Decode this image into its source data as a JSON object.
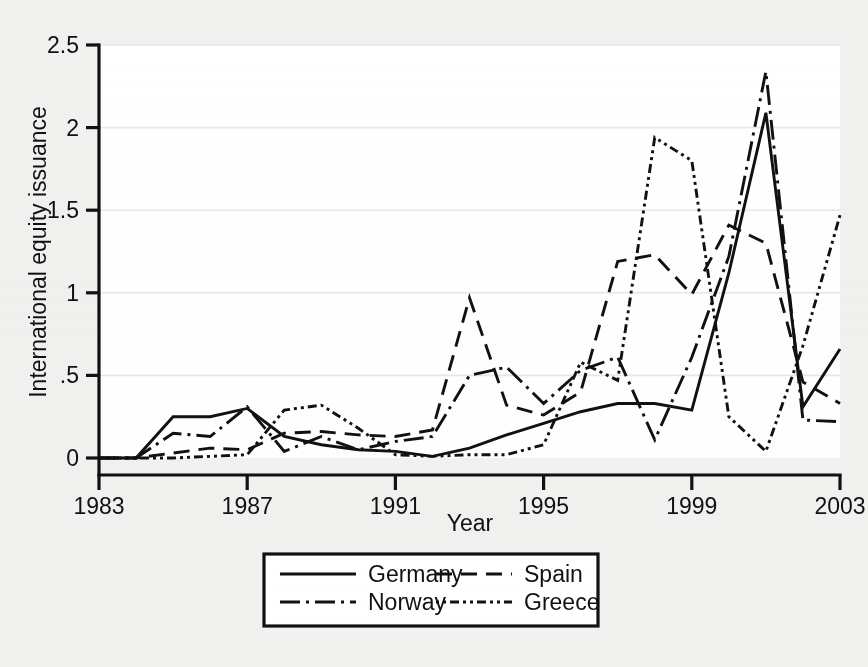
{
  "chart_data": {
    "type": "line",
    "title": "",
    "xlabel": "Year",
    "ylabel": "International equity issuance",
    "xlim": [
      1983,
      2003
    ],
    "ylim": [
      0,
      2.5
    ],
    "x_ticks": [
      1983,
      1987,
      1991,
      1995,
      1999,
      2003
    ],
    "x_tick_labels": [
      "1983",
      "1987",
      "1991",
      "1995",
      "1999",
      "2003"
    ],
    "y_ticks": [
      0,
      0.5,
      1,
      1.5,
      2,
      2.5
    ],
    "y_tick_labels": [
      "0",
      ".5",
      "1",
      "1.5",
      "2",
      "2.5"
    ],
    "grid": "horizontal",
    "legend_position": "bottom-center",
    "x": [
      1983,
      1984,
      1985,
      1986,
      1987,
      1988,
      1989,
      1990,
      1991,
      1992,
      1993,
      1994,
      1995,
      1996,
      1997,
      1998,
      1999,
      2000,
      2001,
      2002,
      2003
    ],
    "series": [
      {
        "name": "Germany",
        "style": "solid",
        "values": [
          0,
          0,
          0.25,
          0.25,
          0.3,
          0.13,
          0.08,
          0.05,
          0.04,
          0.01,
          0.06,
          0.14,
          0.21,
          0.28,
          0.33,
          0.33,
          0.29,
          1.12,
          2.09,
          0.31,
          0.66
        ]
      },
      {
        "name": "Spain",
        "style": "dashed",
        "values": [
          0,
          0,
          0.03,
          0.06,
          0.05,
          0.15,
          0.16,
          0.14,
          0.13,
          0.17,
          0.97,
          0.32,
          0.26,
          0.4,
          1.19,
          1.23,
          0.99,
          1.41,
          1.3,
          0.46,
          0.33
        ]
      },
      {
        "name": "Norway",
        "style": "dash-dot",
        "values": [
          0,
          0,
          0.15,
          0.13,
          0.31,
          0.04,
          0.13,
          0.05,
          0.1,
          0.13,
          0.5,
          0.55,
          0.33,
          0.53,
          0.61,
          0.11,
          0.61,
          1.22,
          2.34,
          0.23,
          0.22
        ]
      },
      {
        "name": "Greece",
        "style": "dotted",
        "values": [
          0,
          0,
          0,
          0.01,
          0.02,
          0.29,
          0.32,
          0.18,
          0.02,
          0.01,
          0.02,
          0.02,
          0.08,
          0.58,
          0.47,
          1.94,
          1.8,
          0.25,
          0.04,
          0.68,
          1.47
        ]
      }
    ]
  },
  "legend": {
    "entries": [
      {
        "label": "Germany",
        "style": "solid"
      },
      {
        "label": "Spain",
        "style": "dashed"
      },
      {
        "label": "Norway",
        "style": "dash-dot"
      },
      {
        "label": "Greece",
        "style": "dotted"
      }
    ]
  },
  "colors": {
    "ink": "#111111",
    "page_background": "#f1f1ef",
    "plot_background": "#ffffff",
    "gridline": "#e8e8e8"
  }
}
